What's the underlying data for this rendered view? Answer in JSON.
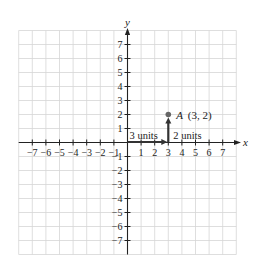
{
  "diagram": {
    "type": "coordinate-plane",
    "axes": {
      "x_label": "x",
      "y_label": "y",
      "x_range": [
        -7,
        7
      ],
      "y_range": [
        -7,
        7
      ],
      "grid_extent": [
        -8,
        8
      ]
    },
    "x_ticks": [
      "-7",
      "-6",
      "-5",
      "-4",
      "-3",
      "-2",
      "-1",
      "1",
      "2",
      "3",
      "4",
      "5",
      "6",
      "7"
    ],
    "y_ticks": [
      "7",
      "6",
      "5",
      "4",
      "3",
      "2",
      "1",
      "-1",
      "-2",
      "-3",
      "-4",
      "-5",
      "-6",
      "-7"
    ],
    "point": {
      "name": "A",
      "x": 3,
      "y": 2,
      "label": "A (3, 2)",
      "label_name": "A",
      "label_coords": "(3, 2)"
    },
    "annotations": {
      "horizontal": "3 units",
      "vertical": "2 units"
    },
    "colors": {
      "grid": "#d6d6d6",
      "axis": "#222222",
      "point": "#666666",
      "arrow": "#333333"
    }
  }
}
